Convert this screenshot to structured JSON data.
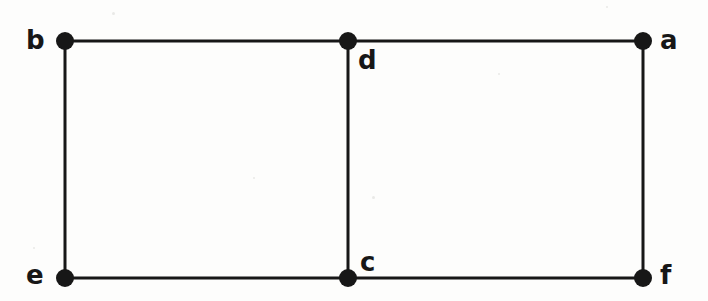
{
  "figure": {
    "kind": "undirected-graph-diagram",
    "width": 708,
    "height": 301,
    "background_color": "#fdfdfc",
    "ink_color": "#171717",
    "edge_stroke_width": 3,
    "vertex_radius": 9
  },
  "graph": {
    "vertices": [
      {
        "id": "b",
        "label": "b",
        "cx": 65,
        "cy": 41,
        "label_x": 26,
        "label_y": 27
      },
      {
        "id": "d",
        "label": "d",
        "cx": 348,
        "cy": 41,
        "label_x": 358,
        "label_y": 47
      },
      {
        "id": "a",
        "label": "a",
        "cx": 643,
        "cy": 41,
        "label_x": 660,
        "label_y": 27
      },
      {
        "id": "e",
        "label": "e",
        "cx": 65,
        "cy": 278,
        "label_x": 26,
        "label_y": 262
      },
      {
        "id": "c",
        "label": "c",
        "cx": 348,
        "cy": 278,
        "label_x": 360,
        "label_y": 249
      },
      {
        "id": "f",
        "label": "f",
        "cx": 643,
        "cy": 278,
        "label_x": 660,
        "label_y": 262
      }
    ],
    "edges": [
      {
        "id": "b-d",
        "from": "b",
        "to": "d",
        "orientation": "horizontal"
      },
      {
        "id": "d-a",
        "from": "d",
        "to": "a",
        "orientation": "horizontal"
      },
      {
        "id": "e-c",
        "from": "e",
        "to": "c",
        "orientation": "horizontal"
      },
      {
        "id": "c-f",
        "from": "c",
        "to": "f",
        "orientation": "horizontal"
      },
      {
        "id": "b-e",
        "from": "b",
        "to": "e",
        "orientation": "vertical"
      },
      {
        "id": "d-c",
        "from": "d",
        "to": "c",
        "orientation": "vertical"
      },
      {
        "id": "a-f",
        "from": "a",
        "to": "f",
        "orientation": "vertical"
      }
    ],
    "vertex_count": 6,
    "edge_count": 7
  }
}
